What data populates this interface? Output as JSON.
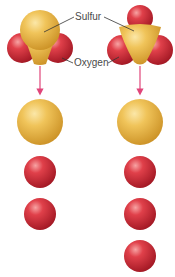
{
  "labels": {
    "sulfur": "Sulfur",
    "oxygen": "Oxygen"
  },
  "molecules": [
    {
      "name": "SO2",
      "sulfur_atoms": 1,
      "oxygen_atoms": 2
    },
    {
      "name": "SO3",
      "sulfur_atoms": 1,
      "oxygen_atoms": 3
    }
  ],
  "colors": {
    "sulfur": "#e8b84a",
    "oxygen": "#d42a35",
    "arrow": "#e0457a",
    "label_text": "#4a4a4a",
    "leader_line": "#333333"
  }
}
